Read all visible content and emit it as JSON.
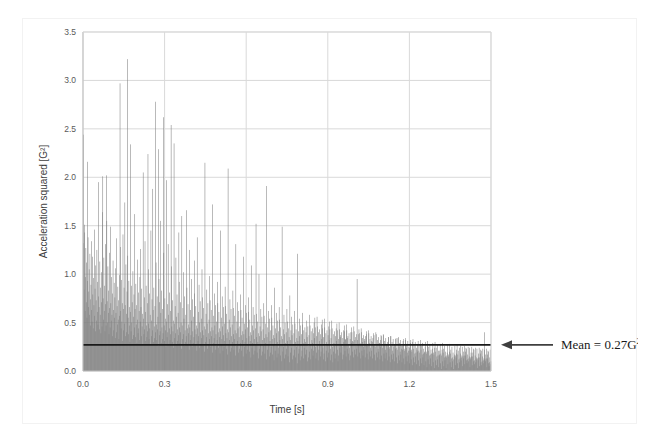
{
  "chart_data": {
    "type": "bar",
    "title": "",
    "xlabel": "Time [s]",
    "ylabel": "Acceleration squared [G²]",
    "xlim": [
      0.0,
      1.5
    ],
    "ylim": [
      0.0,
      3.5
    ],
    "xticks": [
      "0.0",
      "0.3",
      "0.6",
      "0.9",
      "1.2",
      "1.5"
    ],
    "xtick_values": [
      0.0,
      0.3,
      0.6,
      0.9,
      1.2,
      1.5
    ],
    "yticks": [
      "0.0",
      "0.5",
      "1.0",
      "1.5",
      "2.0",
      "2.5",
      "3.0",
      "3.5"
    ],
    "ytick_values": [
      0.0,
      0.5,
      1.0,
      1.5,
      2.0,
      2.5,
      3.0,
      3.5
    ],
    "grid": true,
    "legend": "none",
    "series_name": "Acceleration squared",
    "series_color": "#808080",
    "mean_value": 0.27,
    "mean_line_color": "#1a1a1a",
    "annotation": {
      "text": "Mean = 0.27G",
      "superscript": "2",
      "arrow": "left-arrow",
      "arrow_color": "#3f3f3f"
    },
    "x_step": 0.00125,
    "values": [
      2.44,
      1.32,
      0.84,
      1.51,
      1.43,
      0.62,
      0.97,
      1.27,
      0.71,
      1.12,
      0.55,
      2.16,
      0.93,
      1.38,
      0.66,
      0.82,
      1.05,
      0.58,
      1.21,
      0.74,
      0.47,
      0.89,
      1.34,
      0.63,
      0.51,
      1.18,
      0.79,
      0.44,
      0.96,
      0.68,
      1.46,
      0.57,
      0.85,
      0.41,
      1.09,
      0.73,
      0.52,
      1.25,
      0.61,
      0.92,
      0.48,
      0.77,
      1.95,
      0.66,
      0.43,
      1.13,
      0.58,
      0.86,
      0.39,
      1.02,
      0.71,
      0.46,
      1.64,
      2.01,
      0.75,
      0.53,
      1.17,
      0.62,
      0.88,
      0.41,
      1.31,
      0.69,
      0.47,
      2.02,
      1.55,
      0.72,
      0.5,
      1.08,
      0.6,
      0.83,
      0.38,
      1.22,
      0.65,
      0.45,
      1.49,
      0.7,
      0.52,
      0.97,
      0.58,
      0.8,
      0.36,
      1.14,
      0.63,
      0.42,
      0.91,
      0.55,
      0.76,
      0.34,
      1.06,
      0.6,
      0.4,
      1.37,
      0.67,
      0.48,
      0.87,
      0.53,
      0.73,
      0.33,
      0.99,
      0.57,
      2.97,
      1.28,
      0.62,
      0.44,
      0.94,
      0.51,
      0.7,
      0.31,
      1.41,
      0.64,
      0.42,
      0.86,
      0.49,
      1.74,
      0.68,
      0.36,
      1.1,
      0.59,
      0.4,
      0.82,
      3.22,
      1.19,
      0.55,
      0.38,
      0.93,
      0.47,
      0.66,
      0.3,
      2.34,
      0.61,
      0.41,
      0.88,
      0.5,
      0.71,
      0.33,
      1.03,
      0.56,
      0.37,
      0.79,
      0.45,
      1.62,
      0.64,
      0.35,
      0.9,
      0.48,
      0.68,
      0.29,
      1.15,
      0.53,
      0.39,
      0.81,
      0.44,
      0.62,
      0.32,
      0.97,
      0.51,
      1.26,
      0.66,
      0.36,
      0.85,
      0.46,
      0.59,
      0.28,
      2.05,
      0.54,
      0.38,
      0.76,
      0.43,
      1.34,
      0.61,
      0.31,
      0.88,
      0.47,
      0.35,
      0.7,
      0.41,
      2.24,
      1.05,
      0.49,
      0.33,
      0.8,
      0.44,
      0.58,
      0.27,
      1.45,
      0.52,
      0.36,
      0.74,
      0.42,
      1.88,
      0.63,
      0.3,
      0.86,
      0.46,
      0.34,
      0.67,
      0.4,
      2.78,
      1.12,
      0.48,
      0.32,
      0.77,
      0.43,
      0.56,
      0.26,
      2.29,
      0.95,
      0.37,
      0.71,
      0.41,
      1.55,
      0.6,
      0.29,
      0.83,
      0.45,
      0.33,
      0.64,
      0.39,
      2.62,
      1.22,
      0.47,
      0.31,
      0.75,
      0.42,
      0.54,
      0.25,
      1.97,
      0.51,
      0.35,
      0.69,
      0.4,
      1.31,
      0.58,
      0.28,
      0.81,
      0.44,
      0.32,
      0.62,
      0.38,
      2.54,
      1.08,
      0.46,
      0.3,
      0.73,
      0.41,
      0.52,
      0.24,
      2.35,
      0.49,
      0.34,
      0.67,
      0.39,
      1.17,
      0.56,
      0.27,
      0.79,
      0.43,
      0.31,
      0.6,
      0.37,
      1.43,
      0.92,
      0.45,
      0.29,
      0.71,
      0.4,
      0.5,
      0.23,
      1.6,
      0.47,
      0.33,
      0.65,
      0.38,
      1.02,
      0.54,
      0.26,
      0.77,
      0.42,
      0.3,
      0.58,
      0.36,
      1.66,
      0.86,
      0.44,
      0.28,
      0.69,
      0.39,
      0.48,
      0.22,
      1.25,
      0.45,
      0.32,
      0.63,
      0.37,
      0.95,
      0.52,
      0.25,
      0.74,
      0.41,
      0.29,
      0.56,
      0.35,
      1.14,
      0.8,
      0.43,
      0.27,
      0.67,
      0.38,
      0.47,
      0.21,
      1.38,
      0.44,
      0.31,
      0.61,
      0.36,
      0.89,
      0.5,
      0.24,
      0.72,
      0.4,
      0.28,
      0.54,
      0.34,
      1.05,
      0.76,
      0.42,
      0.26,
      0.65,
      0.37,
      0.46,
      0.2,
      2.15,
      0.43,
      0.3,
      0.59,
      0.35,
      0.84,
      0.49,
      0.23,
      0.7,
      0.39,
      0.27,
      0.53,
      0.33,
      0.98,
      0.73,
      0.41,
      0.25,
      0.63,
      0.36,
      0.45,
      0.19,
      1.72,
      0.42,
      0.29,
      0.57,
      0.34,
      0.8,
      0.47,
      0.22,
      0.68,
      0.38,
      0.26,
      0.51,
      0.32,
      0.92,
      0.7,
      0.4,
      0.24,
      0.61,
      0.35,
      0.44,
      0.18,
      1.45,
      0.41,
      0.28,
      0.55,
      0.33,
      0.77,
      0.46,
      0.21,
      0.66,
      0.37,
      0.25,
      0.49,
      0.31,
      0.87,
      0.67,
      0.39,
      0.23,
      0.59,
      0.34,
      0.43,
      0.17,
      2.09,
      0.4,
      0.27,
      0.53,
      0.32,
      0.74,
      0.45,
      0.2,
      0.64,
      0.36,
      0.24,
      0.48,
      0.3,
      0.83,
      0.65,
      0.38,
      0.22,
      0.57,
      0.33,
      0.42,
      0.16,
      1.31,
      0.39,
      0.26,
      0.51,
      0.31,
      0.71,
      0.44,
      0.19,
      0.62,
      0.35,
      0.23,
      0.46,
      0.29,
      0.79,
      0.63,
      0.37,
      0.21,
      0.55,
      0.32,
      0.41,
      0.15,
      1.18,
      0.38,
      0.25,
      0.49,
      0.3,
      0.68,
      0.43,
      0.18,
      0.6,
      0.34,
      0.22,
      0.45,
      0.28,
      0.76,
      0.61,
      0.36,
      0.2,
      0.53,
      0.31,
      0.4,
      0.14,
      1.09,
      0.37,
      0.24,
      0.47,
      0.29,
      0.66,
      0.42,
      0.17,
      0.58,
      0.33,
      0.21,
      0.44,
      0.27,
      1.52,
      0.59,
      0.35,
      0.19,
      0.51,
      0.3,
      0.39,
      0.13,
      1.0,
      0.36,
      0.23,
      0.46,
      0.28,
      0.64,
      0.41,
      0.16,
      0.56,
      0.32,
      0.2,
      0.43,
      0.26,
      0.7,
      0.57,
      0.34,
      0.18,
      0.49,
      0.29,
      0.38,
      0.12,
      1.91,
      0.35,
      0.22,
      0.45,
      0.27,
      0.62,
      0.4,
      0.15,
      0.54,
      0.31,
      0.19,
      0.42,
      0.25,
      0.68,
      0.55,
      0.33,
      0.17,
      0.47,
      0.28,
      0.37,
      0.11,
      0.86,
      0.34,
      0.21,
      0.44,
      0.26,
      0.6,
      0.39,
      0.14,
      0.52,
      0.3,
      0.18,
      0.41,
      0.24,
      0.66,
      0.53,
      0.32,
      0.16,
      0.45,
      0.27,
      0.36,
      0.1,
      1.49,
      0.33,
      0.2,
      0.43,
      0.25,
      0.58,
      0.38,
      0.13,
      0.5,
      0.29,
      0.17,
      0.4,
      0.23,
      0.64,
      0.51,
      0.31,
      0.15,
      0.44,
      0.26,
      0.35,
      0.09,
      0.78,
      0.32,
      0.19,
      0.42,
      0.24,
      0.56,
      0.37,
      0.12,
      0.48,
      0.28,
      0.16,
      0.39,
      0.22,
      0.62,
      0.49,
      0.3,
      0.14,
      0.43,
      0.25,
      0.34,
      0.08,
      1.21,
      0.31,
      0.18,
      0.41,
      0.23,
      0.54,
      0.36,
      0.11,
      0.47,
      0.27,
      0.15,
      0.38,
      0.21,
      0.6,
      0.48,
      0.29,
      0.13,
      0.42,
      0.24,
      0.33,
      0.45,
      0.3,
      0.17,
      0.4,
      0.22,
      0.52,
      0.35,
      0.1,
      0.46,
      0.26,
      0.14,
      0.37,
      0.2,
      0.58,
      0.47,
      0.28,
      0.12,
      0.41,
      0.23,
      0.32,
      0.44,
      0.29,
      0.16,
      0.39,
      0.21,
      0.5,
      0.34,
      0.55,
      0.45,
      0.25,
      0.13,
      0.36,
      0.19,
      0.56,
      0.46,
      0.27,
      0.11,
      0.4,
      0.22,
      0.31,
      0.43,
      0.28,
      0.15,
      0.38,
      0.2,
      0.48,
      0.33,
      0.53,
      0.44,
      0.24,
      0.12,
      0.35,
      0.18,
      0.54,
      0.45,
      0.26,
      0.1,
      0.39,
      0.21,
      0.3,
      0.42,
      0.27,
      0.14,
      0.37,
      0.19,
      0.46,
      0.32,
      0.51,
      0.43,
      0.23,
      0.11,
      0.34,
      0.17,
      0.52,
      0.44,
      0.25,
      0.09,
      0.38,
      0.2,
      0.29,
      0.41,
      0.26,
      0.13,
      0.36,
      0.18,
      0.44,
      0.31,
      0.49,
      0.42,
      0.22,
      0.1,
      0.33,
      0.16,
      0.5,
      0.43,
      0.24,
      0.35,
      0.37,
      0.19,
      0.28,
      0.4,
      0.25,
      0.12,
      0.34,
      0.17,
      0.42,
      0.3,
      0.47,
      0.41,
      0.21,
      0.33,
      0.32,
      0.15,
      0.48,
      0.42,
      0.23,
      0.34,
      0.36,
      0.18,
      0.27,
      0.39,
      0.24,
      0.11,
      0.33,
      0.16,
      0.4,
      0.29,
      0.45,
      0.4,
      0.2,
      0.31,
      0.3,
      0.14,
      0.46,
      0.41,
      0.22,
      0.32,
      0.35,
      0.17,
      0.26,
      0.38,
      0.23,
      0.95,
      0.32,
      0.15,
      0.38,
      0.28,
      0.43,
      0.39,
      0.19,
      0.29,
      0.28,
      0.13,
      0.44,
      0.4,
      0.21,
      0.3,
      0.34,
      0.16,
      0.25,
      0.37,
      0.22,
      0.33,
      0.31,
      0.14,
      0.36,
      0.27,
      0.41,
      0.38,
      0.18,
      0.28,
      0.26,
      0.12,
      0.42,
      0.39,
      0.2,
      0.29,
      0.33,
      0.15,
      0.24,
      0.36,
      0.21,
      0.31,
      0.3,
      0.13,
      0.34,
      0.26,
      0.39,
      0.37,
      0.17,
      0.27,
      0.25,
      0.11,
      0.4,
      0.38,
      0.19,
      0.28,
      0.32,
      0.14,
      0.23,
      0.35,
      0.2,
      0.29,
      0.29,
      0.12,
      0.32,
      0.25,
      0.37,
      0.36,
      0.16,
      0.26,
      0.24,
      0.1,
      0.38,
      0.37,
      0.18,
      0.27,
      0.31,
      0.13,
      0.22,
      0.34,
      0.19,
      0.27,
      0.28,
      0.11,
      0.3,
      0.24,
      0.35,
      0.35,
      0.15,
      0.25,
      0.23,
      0.09,
      0.36,
      0.36,
      0.17,
      0.26,
      0.3,
      0.12,
      0.21,
      0.33,
      0.18,
      0.25,
      0.27,
      0.1,
      0.28,
      0.23,
      0.33,
      0.34,
      0.14,
      0.24,
      0.22,
      0.08,
      0.34,
      0.35,
      0.16,
      0.25,
      0.29,
      0.11,
      0.2,
      0.32,
      0.17,
      0.23,
      0.26,
      0.09,
      0.26,
      0.22,
      0.31,
      0.33,
      0.13,
      0.23,
      0.21,
      0.07,
      0.32,
      0.34,
      0.15,
      0.24,
      0.28,
      0.1,
      0.19,
      0.31,
      0.16,
      0.21,
      0.25,
      0.08,
      0.24,
      0.21,
      0.29,
      0.32,
      0.12,
      0.22,
      0.2,
      0.06,
      0.3,
      0.33,
      0.14,
      0.23,
      0.27,
      0.09,
      0.18,
      0.3,
      0.15,
      0.19,
      0.24,
      0.07,
      0.22,
      0.2,
      0.27,
      0.31,
      0.11,
      0.21,
      0.19,
      0.05,
      0.28,
      0.32,
      0.13,
      0.22,
      0.26,
      0.08,
      0.17,
      0.29,
      0.14,
      0.18,
      0.23,
      0.06,
      0.2,
      0.19,
      0.25,
      0.3,
      0.1,
      0.2,
      0.18,
      0.04,
      0.26,
      0.31,
      0.12,
      0.21,
      0.25,
      0.07,
      0.16,
      0.28,
      0.13,
      0.17,
      0.22,
      0.05,
      0.18,
      0.18,
      0.23,
      0.29,
      0.09,
      0.19,
      0.17,
      0.03,
      0.24,
      0.3,
      0.11,
      0.2,
      0.24,
      0.06,
      0.15,
      0.27,
      0.12,
      0.16,
      0.21,
      0.04,
      0.16,
      0.17,
      0.21,
      0.28,
      0.08,
      0.18,
      0.16,
      0.02,
      0.22,
      0.29,
      0.1,
      0.19,
      0.23,
      0.05,
      0.14,
      0.26,
      0.11,
      0.15,
      0.2,
      0.03,
      0.14,
      0.16,
      0.19,
      0.27,
      0.07,
      0.17,
      0.15,
      0.01,
      0.2,
      0.28,
      0.09,
      0.18,
      0.22,
      0.04,
      0.13,
      0.25,
      0.1,
      0.14,
      0.19,
      0.02,
      0.12,
      0.15,
      0.17,
      0.26,
      0.06,
      0.16,
      0.14,
      0.22,
      0.18,
      0.27,
      0.08,
      0.17,
      0.21,
      0.03,
      0.12,
      0.24,
      0.09,
      0.13,
      0.18,
      0.26,
      0.11,
      0.14,
      0.16,
      0.25,
      0.05,
      0.15,
      0.13,
      0.2,
      0.16,
      0.26,
      0.07,
      0.16,
      0.2,
      0.24,
      0.11,
      0.23,
      0.08,
      0.12,
      0.17,
      0.25,
      0.1,
      0.13,
      0.15,
      0.24,
      0.04,
      0.14,
      0.12,
      0.19,
      0.15,
      0.25,
      0.06,
      0.15,
      0.19,
      0.23,
      0.1,
      0.22,
      0.07,
      0.11,
      0.16,
      0.24,
      0.09,
      0.12,
      0.14,
      0.23,
      0.03,
      0.13,
      0.11,
      0.18,
      0.14,
      0.24,
      0.05,
      0.14,
      0.18,
      0.22,
      0.09,
      0.21,
      0.06,
      0.1,
      0.15,
      0.23,
      0.08,
      0.11,
      0.13,
      0.22,
      0.4,
      0.12,
      0.1,
      0.17,
      0.13,
      0.23,
      0.04,
      0.13,
      0.17,
      0.21,
      0.08,
      0.2,
      0.05,
      0.09,
      0.14,
      0.22,
      0.07,
      0.1
    ]
  }
}
